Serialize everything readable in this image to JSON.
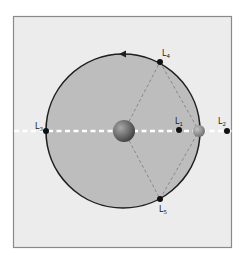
{
  "diagram": {
    "colors": {
      "background": "#ffffff",
      "panel_fill": "#ececec",
      "panel_border": "#8a8a8a",
      "orbit_fill": "#bdbdbd",
      "orbit_stroke": "#1f1f1f",
      "axis_dash": "#ffffff",
      "triangle_dash": "#888888",
      "point_fill": "#111111",
      "primary_body": "#6b6b6b",
      "secondary_body": "#8c8c8c"
    },
    "orbit": {
      "cx": 123,
      "cy": 131,
      "r": 77,
      "direction": "counter-clockwise",
      "arrow_icon": "orbit-direction-arrow"
    },
    "bodies": [
      {
        "name": "primary-body",
        "cx": 124,
        "cy": 131,
        "r": 11
      },
      {
        "name": "secondary-body",
        "cx": 199,
        "cy": 131,
        "r": 6
      }
    ],
    "points": [
      {
        "id": "L1",
        "label": "L",
        "sub": "1",
        "x": 179,
        "y": 130,
        "lx": 175,
        "ly": 124
      },
      {
        "id": "L2",
        "label": "L",
        "sub": "2",
        "x": 227,
        "y": 131,
        "lx": 218,
        "ly": 124
      },
      {
        "id": "L3",
        "label": "L",
        "sub": "3",
        "x": 46,
        "y": 131,
        "lx": 35,
        "ly": 129
      },
      {
        "id": "L4",
        "label": "L",
        "sub": "4",
        "x": 160,
        "y": 62,
        "lx": 162,
        "ly": 55
      },
      {
        "id": "L5",
        "label": "L",
        "sub": "5",
        "x": 160,
        "y": 199,
        "lx": 159,
        "ly": 212
      }
    ]
  }
}
